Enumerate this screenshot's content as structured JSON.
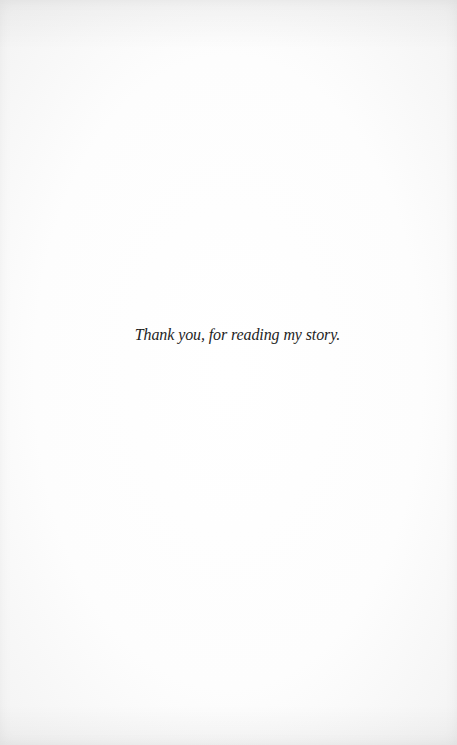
{
  "page": {
    "closing_line": "Thank you, for reading my story."
  }
}
